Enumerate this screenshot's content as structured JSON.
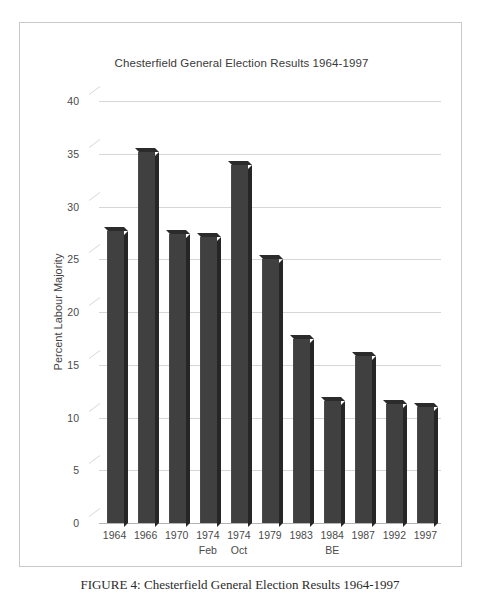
{
  "figure": {
    "caption": "FIGURE 4: Chesterfield General Election Results 1964-1997"
  },
  "colors": {
    "bar_front": "#404040",
    "bar_side": "#262626",
    "bar_top": "#2b2b2b",
    "gridline": "#d6d6d6",
    "axis": "#b4b4b4",
    "frame": "#c9c9c9",
    "text": "#4a4a4a",
    "background": "#ffffff"
  },
  "chart_data": {
    "type": "bar",
    "title": "Chesterfield General Election Results 1964-1997",
    "xlabel": "",
    "ylabel": "Percent Labour Majority",
    "ylim": [
      0,
      40
    ],
    "ytick_step": 5,
    "yticks": [
      "40",
      "35",
      "30",
      "25",
      "20",
      "15",
      "10",
      "5",
      "0"
    ],
    "grid": true,
    "legend": false,
    "categories": [
      "1964",
      "1966",
      "1970",
      "1974 Feb",
      "1974 Oct",
      "1979",
      "1983",
      "1984 BE",
      "1987",
      "1992",
      "1997"
    ],
    "category_lines": [
      {
        "line1": "1964",
        "line2": ""
      },
      {
        "line1": "1966",
        "line2": ""
      },
      {
        "line1": "1970",
        "line2": ""
      },
      {
        "line1": "1974",
        "line2": "Feb"
      },
      {
        "line1": "1974",
        "line2": "Oct"
      },
      {
        "line1": "1979",
        "line2": ""
      },
      {
        "line1": "1983",
        "line2": ""
      },
      {
        "line1": "1984",
        "line2": "BE"
      },
      {
        "line1": "1987",
        "line2": ""
      },
      {
        "line1": "1992",
        "line2": ""
      },
      {
        "line1": "1997",
        "line2": ""
      }
    ],
    "values": [
      27.7,
      35.2,
      27.4,
      27.1,
      33.9,
      25.0,
      17.4,
      11.6,
      15.8,
      11.3,
      11.0
    ]
  }
}
